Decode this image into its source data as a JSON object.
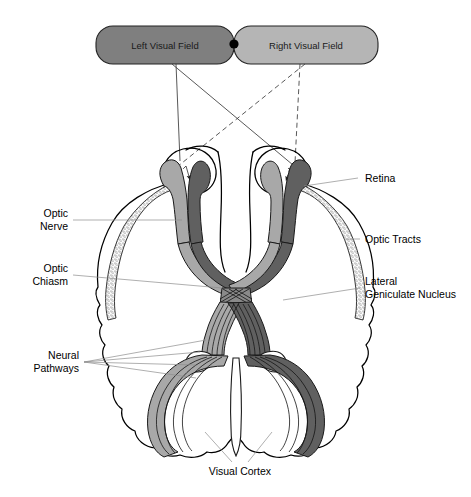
{
  "figure": {
    "background_color": "#ffffff"
  },
  "visual_fields": {
    "left": {
      "label": "Left Visual Field",
      "fill_color": "#7f7f7f",
      "text_color": "#1a1a1a"
    },
    "right": {
      "label": "Right Visual Field",
      "fill_color": "#b5b5b5",
      "text_color": "#1a1a1a"
    },
    "fixation_point": {
      "name": "fixation-dot",
      "color": "#000000"
    }
  },
  "labels": {
    "optic_nerve": {
      "line1": "Optic",
      "line2": "Nerve"
    },
    "optic_chiasm": {
      "line1": "Optic",
      "line2": "Chiasm"
    },
    "neural_pathways": {
      "line1": "Neural",
      "line2": "Pathways"
    },
    "retina": {
      "line1": "Retina"
    },
    "optic_tracts": {
      "line1": "Optic Tracts"
    },
    "lateral_geniculate_nucleus": {
      "line1": "Lateral",
      "line2": "Geniculate Nucleus"
    },
    "visual_cortex": {
      "line1": "Visual Cortex"
    }
  },
  "colors": {
    "pathway_light": "#a8a8a8",
    "pathway_dark": "#606060",
    "cortex_stipple": "#d8d8d8",
    "outline": "#000000",
    "leader_line": "#8d8d8d",
    "ray_solid": "#3a3a3a",
    "ray_dashed": "#3a3a3a"
  },
  "ray_lines": {
    "from_left_field": {
      "style": "solid",
      "count": 2
    },
    "from_right_field": {
      "style": "dashed",
      "count": 2
    }
  }
}
